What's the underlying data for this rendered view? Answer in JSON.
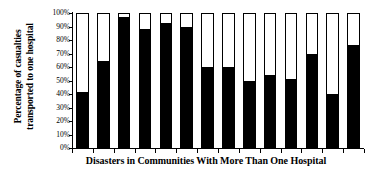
{
  "chart_data": {
    "type": "bar",
    "title": "",
    "xlabel": "Disasters in Communities With More Than One Hospital",
    "ylabel": "Percentage of casualties transported to one hospital",
    "ylabel_line1": "Percentage of casualties",
    "ylabel_line2": "transported to one hospital",
    "ylim": [
      0,
      100
    ],
    "ytick_labels": [
      "100%",
      "90%",
      "80%",
      "70%",
      "60%",
      "50%",
      "40%",
      "30%",
      "20%",
      "10%",
      "0%"
    ],
    "ytick_values": [
      100,
      90,
      80,
      70,
      60,
      50,
      40,
      30,
      20,
      10,
      0
    ],
    "categories": [
      "1",
      "2",
      "3",
      "4",
      "5",
      "6",
      "7",
      "8",
      "9",
      "10",
      "11",
      "12",
      "13",
      "14"
    ],
    "values": [
      41,
      65,
      98,
      89,
      93,
      90,
      60,
      60,
      50,
      54,
      51,
      70,
      40,
      77
    ],
    "series": [
      {
        "name": "Percentage transported to one hospital",
        "values": [
          41,
          65,
          98,
          89,
          93,
          90,
          60,
          60,
          50,
          54,
          51,
          70,
          40,
          77
        ],
        "color": "#000000"
      },
      {
        "name": "Remainder",
        "values": [
          59,
          35,
          2,
          11,
          7,
          10,
          40,
          40,
          50,
          46,
          49,
          30,
          60,
          23
        ],
        "color": "#ffffff"
      }
    ],
    "grid": false,
    "legend": "none",
    "bar_outline_color": "#000000",
    "bar_fill_color": "#000000",
    "bar_empty_color": "#ffffff",
    "background_color": "#ffffff",
    "xtick_labels_visible": false
  }
}
